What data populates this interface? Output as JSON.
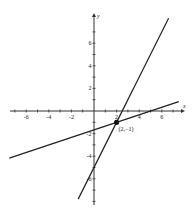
{
  "chart_data": {
    "type": "line",
    "title": "",
    "xlabel": "x",
    "ylabel": "y",
    "xlim": [
      -7.5,
      7.5
    ],
    "ylim": [
      -8,
      8
    ],
    "grid": false,
    "x_ticks": [
      -6,
      -4,
      -2,
      2,
      4,
      6
    ],
    "y_ticks": [
      -6,
      -4,
      -2,
      2,
      4,
      6
    ],
    "x_tick_labels": [
      "-6",
      "-4",
      "-2",
      "2",
      "4",
      "6"
    ],
    "y_tick_labels": [
      "-6",
      "-4",
      "-2",
      "2",
      "4",
      "6"
    ],
    "series": [
      {
        "name": "steep line",
        "equation": "y = 2x - 5",
        "x": [
          -1.4,
          6.6
        ],
        "y": [
          -7.8,
          8.2
        ]
      },
      {
        "name": "shallow line",
        "equation": "y = (x - 5)/3",
        "x": [
          -7.5,
          7.5
        ],
        "y": [
          -4.17,
          0.83
        ]
      }
    ],
    "annotations": [
      {
        "type": "point",
        "x": 2,
        "y": -1,
        "label": "(2,−1)"
      }
    ]
  },
  "axes": {
    "x_label": "x",
    "y_label": "y"
  },
  "point_label": "(2,−1)"
}
